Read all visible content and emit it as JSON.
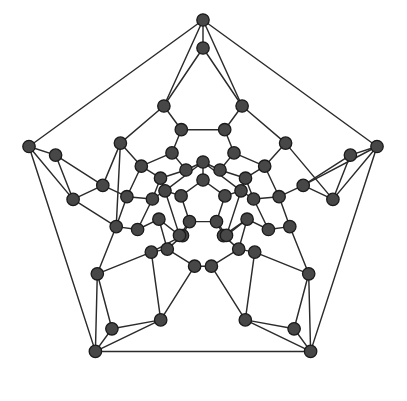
{
  "figure": {
    "background_color": "#ffffff",
    "vertex_fill": "#474747",
    "vertex_stroke": "#1a1a1a",
    "vertex_radius": 6.2,
    "edge_color": "#2b2b2b",
    "edge_width": 1.45,
    "vertex_count": 60,
    "edge_count": 90,
    "symmetry": "5-fold rotational"
  },
  "chart_data": {
    "type": "scatter",
    "xlabel": "",
    "ylabel": "",
    "xlim": [
      0,
      407
    ],
    "ylim": [
      0,
      401
    ],
    "grid": false,
    "legend": "none",
    "graph": {
      "directed": false,
      "vertex_count": 60,
      "edge_count": 90,
      "layout": "schlegel-pentagonal",
      "center": [
        203,
        203
      ],
      "rings": [
        {
          "name": "outer-pentagon",
          "radius": 183,
          "count": 5
        },
        {
          "name": "outer-hub",
          "radius": 155,
          "count": 5
        },
        {
          "name": "ring-3",
          "radius": 142,
          "count": 10
        },
        {
          "name": "ring-4",
          "radius": 113,
          "count": 10
        },
        {
          "name": "ring-5",
          "radius": 86,
          "count": 10
        },
        {
          "name": "ring-6",
          "radius": 62,
          "count": 10
        },
        {
          "name": "ring-7",
          "radius": 41,
          "count": 5
        },
        {
          "name": "inner-pentagon",
          "radius": 23,
          "count": 5
        }
      ],
      "nodes": [
        {
          "id": 0,
          "x": 203.0,
          "y": 20.0
        },
        {
          "id": 1,
          "x": 377.0,
          "y": 146.5
        },
        {
          "id": 2,
          "x": 310.6,
          "y": 351.4
        },
        {
          "id": 3,
          "x": 95.4,
          "y": 351.4
        },
        {
          "id": 4,
          "x": 29.0,
          "y": 146.5
        },
        {
          "id": 5,
          "x": 203.0,
          "y": 48.0
        },
        {
          "id": 6,
          "x": 350.4,
          "y": 155.1
        },
        {
          "id": 7,
          "x": 294.1,
          "y": 328.8
        },
        {
          "id": 8,
          "x": 111.9,
          "y": 328.8
        },
        {
          "id": 9,
          "x": 55.6,
          "y": 155.1
        },
        {
          "id": 10,
          "x": 163.9,
          "y": 106.0
        },
        {
          "id": 11,
          "x": 242.1,
          "y": 106.0
        },
        {
          "id": 12,
          "x": 332.9,
          "y": 199.4
        },
        {
          "id": 13,
          "x": 308.7,
          "y": 273.8
        },
        {
          "id": 14,
          "x": 245.3,
          "y": 319.9
        },
        {
          "id": 15,
          "x": 160.7,
          "y": 319.9
        },
        {
          "id": 16,
          "x": 97.3,
          "y": 273.8
        },
        {
          "id": 17,
          "x": 73.1,
          "y": 199.4
        },
        {
          "id": 18,
          "x": 120.4,
          "y": 143.1
        },
        {
          "id": 19,
          "x": 285.6,
          "y": 143.1
        },
        {
          "id": 20,
          "x": 181.3,
          "y": 129.7
        },
        {
          "id": 21,
          "x": 224.7,
          "y": 129.7
        },
        {
          "id": 22,
          "x": 303.2,
          "y": 185.4
        },
        {
          "id": 23,
          "x": 289.8,
          "y": 226.6
        },
        {
          "id": 24,
          "x": 254.7,
          "y": 252.1
        },
        {
          "id": 25,
          "x": 211.4,
          "y": 266.2
        },
        {
          "id": 26,
          "x": 151.3,
          "y": 252.1
        },
        {
          "id": 27,
          "x": 194.6,
          "y": 266.2
        },
        {
          "id": 28,
          "x": 116.2,
          "y": 226.6
        },
        {
          "id": 29,
          "x": 102.8,
          "y": 185.4
        },
        {
          "id": 30,
          "x": 141.3,
          "y": 166.2
        },
        {
          "id": 31,
          "x": 264.7,
          "y": 166.2
        },
        {
          "id": 32,
          "x": 172.0,
          "y": 152.9
        },
        {
          "id": 33,
          "x": 234.0,
          "y": 152.9
        },
        {
          "id": 34,
          "x": 279.1,
          "y": 196.7
        },
        {
          "id": 35,
          "x": 268.4,
          "y": 229.5
        },
        {
          "id": 36,
          "x": 238.7,
          "y": 249.1
        },
        {
          "id": 37,
          "x": 167.3,
          "y": 249.1
        },
        {
          "id": 38,
          "x": 137.6,
          "y": 229.5
        },
        {
          "id": 39,
          "x": 126.9,
          "y": 196.7
        },
        {
          "id": 40,
          "x": 160.5,
          "y": 178.2
        },
        {
          "id": 41,
          "x": 245.5,
          "y": 178.2
        },
        {
          "id": 42,
          "x": 186.0,
          "y": 170.0
        },
        {
          "id": 43,
          "x": 220.0,
          "y": 170.0
        },
        {
          "id": 44,
          "x": 253.6,
          "y": 199.0
        },
        {
          "id": 45,
          "x": 247.1,
          "y": 219.2
        },
        {
          "id": 46,
          "x": 223.5,
          "y": 235.6
        },
        {
          "id": 47,
          "x": 182.5,
          "y": 235.6
        },
        {
          "id": 48,
          "x": 158.9,
          "y": 219.2
        },
        {
          "id": 49,
          "x": 152.4,
          "y": 199.0
        },
        {
          "id": 50,
          "x": 203.0,
          "y": 162.0
        },
        {
          "id": 51,
          "x": 241.0,
          "y": 190.8
        },
        {
          "id": 52,
          "x": 226.5,
          "y": 235.4
        },
        {
          "id": 53,
          "x": 179.5,
          "y": 235.4
        },
        {
          "id": 54,
          "x": 165.0,
          "y": 190.8
        },
        {
          "id": 55,
          "x": 203.0,
          "y": 180.0
        },
        {
          "id": 56,
          "x": 224.9,
          "y": 195.9
        },
        {
          "id": 57,
          "x": 216.5,
          "y": 221.6
        },
        {
          "id": 58,
          "x": 189.5,
          "y": 221.6
        },
        {
          "id": 59,
          "x": 181.1,
          "y": 195.9
        }
      ],
      "edges": [
        [
          0,
          1
        ],
        [
          1,
          2
        ],
        [
          2,
          3
        ],
        [
          3,
          4
        ],
        [
          4,
          0
        ],
        [
          0,
          5
        ],
        [
          1,
          6
        ],
        [
          2,
          7
        ],
        [
          3,
          8
        ],
        [
          4,
          9
        ],
        [
          4,
          17
        ],
        [
          0,
          10
        ],
        [
          0,
          11
        ],
        [
          1,
          12
        ],
        [
          1,
          22
        ],
        [
          2,
          13
        ],
        [
          2,
          14
        ],
        [
          3,
          15
        ],
        [
          3,
          16
        ],
        [
          5,
          10
        ],
        [
          5,
          11
        ],
        [
          6,
          12
        ],
        [
          6,
          22
        ],
        [
          7,
          13
        ],
        [
          7,
          14
        ],
        [
          8,
          15
        ],
        [
          8,
          16
        ],
        [
          9,
          17
        ],
        [
          9,
          29
        ],
        [
          10,
          18
        ],
        [
          10,
          20
        ],
        [
          11,
          19
        ],
        [
          11,
          21
        ],
        [
          12,
          19
        ],
        [
          12,
          22
        ],
        [
          13,
          23
        ],
        [
          13,
          24
        ],
        [
          14,
          24
        ],
        [
          14,
          25
        ],
        [
          15,
          26
        ],
        [
          15,
          27
        ],
        [
          16,
          26
        ],
        [
          16,
          28
        ],
        [
          17,
          28
        ],
        [
          17,
          29
        ],
        [
          18,
          29
        ],
        [
          18,
          30
        ],
        [
          19,
          31
        ],
        [
          22,
          34
        ],
        [
          20,
          21
        ],
        [
          20,
          32
        ],
        [
          21,
          33
        ],
        [
          23,
          34
        ],
        [
          23,
          35
        ],
        [
          24,
          36
        ],
        [
          25,
          27
        ],
        [
          25,
          36
        ],
        [
          26,
          37
        ],
        [
          27,
          37
        ],
        [
          28,
          38
        ],
        [
          28,
          39
        ],
        [
          29,
          39
        ],
        [
          30,
          32
        ],
        [
          30,
          40
        ],
        [
          31,
          33
        ],
        [
          31,
          34
        ],
        [
          32,
          42
        ],
        [
          33,
          43
        ],
        [
          34,
          44
        ],
        [
          35,
          44
        ],
        [
          35,
          45
        ],
        [
          36,
          45
        ],
        [
          36,
          46
        ],
        [
          37,
          47
        ],
        [
          37,
          48
        ],
        [
          38,
          48
        ],
        [
          38,
          49
        ],
        [
          39,
          49
        ],
        [
          40,
          42
        ],
        [
          40,
          49
        ],
        [
          41,
          43
        ],
        [
          41,
          44
        ],
        [
          42,
          50
        ],
        [
          43,
          50
        ],
        [
          44,
          51
        ],
        [
          45,
          52
        ],
        [
          46,
          52
        ],
        [
          46,
          57
        ],
        [
          47,
          53
        ],
        [
          47,
          58
        ],
        [
          48,
          53
        ],
        [
          49,
          54
        ],
        [
          50,
          55
        ],
        [
          51,
          56
        ],
        [
          52,
          57
        ],
        [
          53,
          58
        ],
        [
          54,
          59
        ],
        [
          55,
          56
        ],
        [
          56,
          57
        ],
        [
          57,
          58
        ],
        [
          58,
          59
        ],
        [
          59,
          55
        ],
        [
          41,
          51
        ],
        [
          40,
          54
        ],
        [
          38,
          48
        ],
        [
          30,
          39
        ],
        [
          18,
          28
        ],
        [
          31,
          41
        ],
        [
          51,
          52
        ],
        [
          54,
          53
        ],
        [
          50,
          51
        ],
        [
          50,
          54
        ],
        [
          35,
          23
        ],
        [
          45,
          46
        ],
        [
          26,
          47
        ]
      ]
    }
  }
}
